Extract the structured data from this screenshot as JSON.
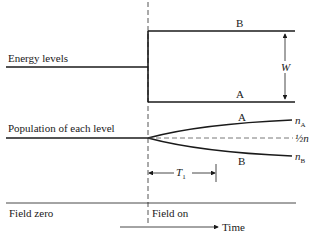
{
  "diagram": {
    "energy_section": {
      "label": "Energy levels",
      "level_upper": "B",
      "level_lower": "A",
      "gap_label": "W"
    },
    "population_section": {
      "label": "Population of each level",
      "curve_upper": "A",
      "curve_lower": "B",
      "end_upper": "n",
      "end_upper_sub": "A",
      "end_mid": "½n",
      "end_lower": "n",
      "end_lower_sub": "B",
      "time_constant": "T",
      "time_constant_sub": "1"
    },
    "footer": {
      "left_label": "Field zero",
      "right_label": "Field on",
      "axis_label": "Time"
    },
    "colors": {
      "ink": "#1a1a1a",
      "dashed": "#555555"
    }
  }
}
